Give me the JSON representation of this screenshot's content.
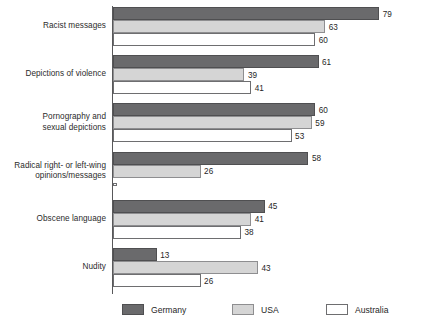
{
  "chart_data": {
    "type": "bar",
    "orientation": "horizontal",
    "grouped": true,
    "title": "",
    "subtitle": "",
    "xlabel": "",
    "ylabel": "",
    "xlim": [
      0,
      85
    ],
    "grid": false,
    "legend_position": "bottom",
    "categories": [
      "Racist messages",
      "Depictions of violence",
      "Pornography and\nsexual depictions",
      "Radical right- or left-wing\nopinions/messages",
      "Obscene language",
      "Nudity"
    ],
    "series": [
      {
        "name": "Germany",
        "color": "#6a6a6c",
        "values": [
          79,
          61,
          60,
          58,
          45,
          13
        ],
        "labels": [
          "79",
          "61",
          "60",
          "58",
          "45",
          "13"
        ]
      },
      {
        "name": "USA",
        "color": "#d5d5d5",
        "values": [
          63,
          39,
          59,
          26,
          41,
          43
        ],
        "labels": [
          "63",
          "39",
          "59",
          "26",
          "41",
          "43"
        ]
      },
      {
        "name": "Australia",
        "color": "#ffffff",
        "values": [
          60,
          41,
          53,
          0,
          38,
          26
        ],
        "labels": [
          "60",
          "41",
          "53",
          "",
          "38",
          "26"
        ]
      }
    ]
  },
  "legend": {
    "items": [
      {
        "label": "Germany",
        "swatch": "dark-gray-swatch"
      },
      {
        "label": "USA",
        "swatch": "light-gray-swatch"
      },
      {
        "label": "Australia",
        "swatch": "white-swatch"
      }
    ]
  },
  "colors": {
    "germany": "#6a6a6c",
    "usa": "#d5d5d5",
    "australia": "#ffffff",
    "axis": "#58585a",
    "text": "#1f1f1f",
    "background": "#ffffff"
  }
}
